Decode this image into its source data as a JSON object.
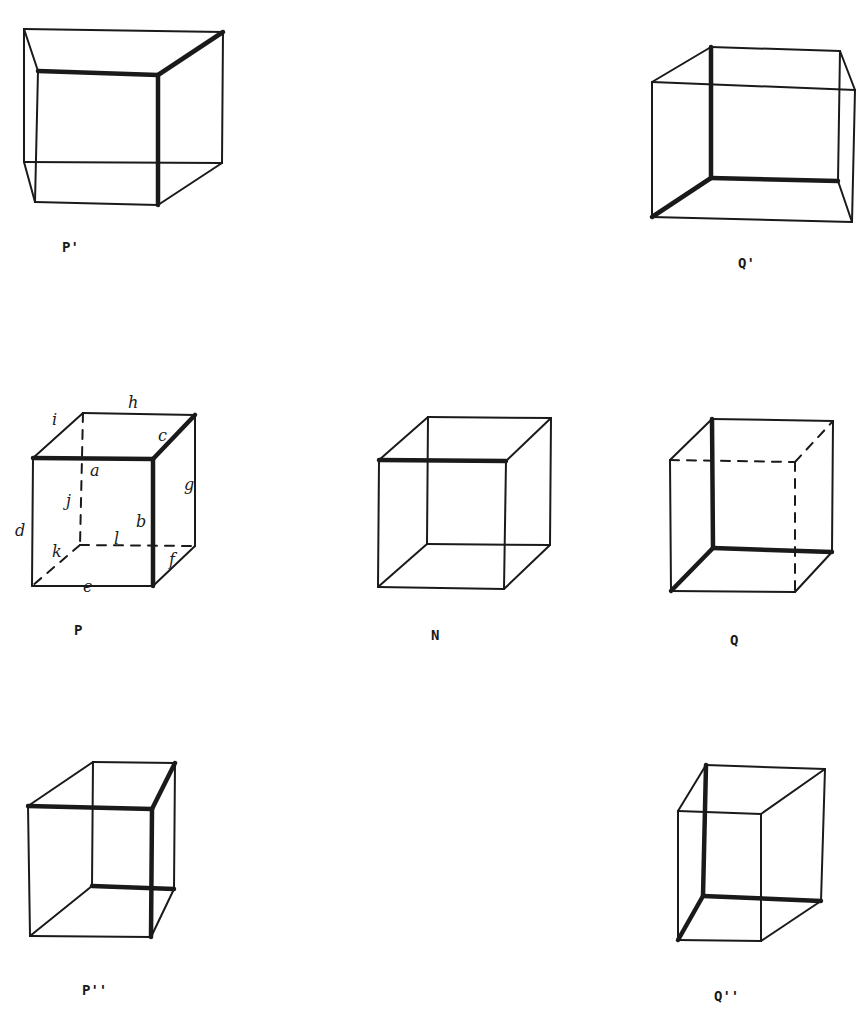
{
  "figure": {
    "background": "#ffffff",
    "ink": "#1a1a1a",
    "cubes": [
      {
        "id": "P-prime",
        "label": "P'",
        "label_pos": [
          62,
          252
        ],
        "thin": [
          [
            24,
            29,
            223,
            32
          ],
          [
            24,
            29,
            24,
            162
          ],
          [
            223,
            32,
            222,
            163
          ],
          [
            24,
            162,
            222,
            163
          ],
          [
            24,
            29,
            38,
            71
          ],
          [
            24,
            162,
            35,
            202
          ],
          [
            222,
            163,
            158,
            205
          ],
          [
            38,
            71,
            35,
            202
          ],
          [
            35,
            202,
            158,
            205
          ]
        ],
        "thick": [
          [
            38,
            71,
            158,
            75
          ],
          [
            158,
            75,
            158,
            205
          ],
          [
            158,
            75,
            223,
            32
          ]
        ],
        "dashed": []
      },
      {
        "id": "Q-prime",
        "label": "Q'",
        "label_pos": [
          738,
          268
        ],
        "thin": [
          [
            711,
            47,
            840,
            51
          ],
          [
            840,
            51,
            838,
            181
          ],
          [
            652,
            82,
            855,
            90
          ],
          [
            652,
            82,
            652,
            217
          ],
          [
            855,
            90,
            852,
            222
          ],
          [
            652,
            217,
            852,
            222
          ],
          [
            652,
            82,
            711,
            47
          ],
          [
            840,
            51,
            855,
            90
          ],
          [
            838,
            181,
            852,
            222
          ]
        ],
        "thick": [
          [
            711,
            47,
            711,
            178
          ],
          [
            711,
            178,
            838,
            181
          ],
          [
            652,
            217,
            711,
            178
          ]
        ],
        "dashed": []
      },
      {
        "id": "P",
        "label": "P",
        "label_pos": [
          74,
          635
        ],
        "thin": [
          [
            83,
            413,
            195,
            415
          ],
          [
            195,
            415,
            195,
            546
          ],
          [
            33,
            458,
            83,
            413
          ],
          [
            33,
            458,
            32,
            586
          ],
          [
            32,
            586,
            153,
            586
          ],
          [
            153,
            586,
            195,
            546
          ]
        ],
        "thick": [
          [
            33,
            458,
            153,
            459
          ],
          [
            153,
            459,
            153,
            586
          ],
          [
            153,
            459,
            195,
            415
          ]
        ],
        "dashed": [
          [
            83,
            413,
            80,
            545
          ],
          [
            80,
            545,
            195,
            546
          ],
          [
            80,
            545,
            32,
            586
          ]
        ],
        "edge_labels": [
          {
            "text": "a",
            "x": 90,
            "y": 476
          },
          {
            "text": "b",
            "x": 136,
            "y": 527
          },
          {
            "text": "c",
            "x": 158,
            "y": 441
          },
          {
            "text": "d",
            "x": 15,
            "y": 536
          },
          {
            "text": "e",
            "x": 83,
            "y": 592
          },
          {
            "text": "f",
            "x": 169,
            "y": 565
          },
          {
            "text": "g",
            "x": 184,
            "y": 490
          },
          {
            "text": "h",
            "x": 128,
            "y": 408
          },
          {
            "text": "i",
            "x": 52,
            "y": 425
          },
          {
            "text": "j",
            "x": 66,
            "y": 506
          },
          {
            "text": "k",
            "x": 52,
            "y": 557
          },
          {
            "text": "l",
            "x": 114,
            "y": 544
          }
        ]
      },
      {
        "id": "N",
        "label": "N",
        "label_pos": [
          431,
          640
        ],
        "thin": [
          [
            428,
            417,
            551,
            418
          ],
          [
            428,
            417,
            427,
            544
          ],
          [
            551,
            418,
            550,
            545
          ],
          [
            427,
            544,
            550,
            545
          ],
          [
            379,
            460,
            378,
            587
          ],
          [
            506,
            461,
            504,
            589
          ],
          [
            378,
            587,
            504,
            589
          ],
          [
            379,
            460,
            428,
            417
          ],
          [
            506,
            461,
            551,
            418
          ],
          [
            378,
            587,
            427,
            544
          ],
          [
            504,
            589,
            550,
            545
          ]
        ],
        "thick": [
          [
            379,
            460,
            506,
            461
          ]
        ],
        "dashed": []
      },
      {
        "id": "Q",
        "label": "Q",
        "label_pos": [
          730,
          645
        ],
        "thin": [
          [
            712,
            419,
            833,
            421
          ],
          [
            833,
            421,
            832,
            552
          ],
          [
            670,
            460,
            671,
            591
          ],
          [
            671,
            591,
            795,
            592
          ],
          [
            670,
            460,
            712,
            419
          ],
          [
            795,
            592,
            832,
            552
          ]
        ],
        "thick": [
          [
            712,
            419,
            713,
            548
          ],
          [
            713,
            548,
            832,
            552
          ],
          [
            671,
            591,
            713,
            548
          ]
        ],
        "dashed": [
          [
            670,
            460,
            795,
            462
          ],
          [
            795,
            462,
            795,
            592
          ],
          [
            795,
            462,
            833,
            421
          ]
        ]
      },
      {
        "id": "P-double-prime",
        "label": "P''",
        "label_pos": [
          82,
          995
        ],
        "thin": [
          [
            93,
            762,
            175,
            763
          ],
          [
            93,
            762,
            92,
            886
          ],
          [
            175,
            763,
            174,
            889
          ],
          [
            28,
            806,
            93,
            762
          ],
          [
            28,
            806,
            30,
            936
          ],
          [
            30,
            936,
            151,
            937
          ],
          [
            30,
            936,
            92,
            886
          ],
          [
            151,
            937,
            174,
            889
          ]
        ],
        "thick": [
          [
            28,
            806,
            152,
            809
          ],
          [
            152,
            809,
            151,
            937
          ],
          [
            152,
            809,
            175,
            763
          ],
          [
            92,
            886,
            174,
            889
          ]
        ],
        "dashed": []
      },
      {
        "id": "Q-double-prime",
        "label": "Q''",
        "label_pos": [
          714,
          1001
        ],
        "thin": [
          [
            706,
            765,
            825,
            769
          ],
          [
            825,
            769,
            821,
            901
          ],
          [
            678,
            811,
            761,
            814
          ],
          [
            678,
            811,
            678,
            940
          ],
          [
            761,
            814,
            761,
            941
          ],
          [
            678,
            940,
            761,
            941
          ],
          [
            678,
            811,
            706,
            765
          ],
          [
            761,
            814,
            825,
            769
          ],
          [
            761,
            941,
            821,
            901
          ]
        ],
        "thick": [
          [
            706,
            765,
            703,
            896
          ],
          [
            703,
            896,
            821,
            901
          ],
          [
            678,
            940,
            703,
            896
          ]
        ],
        "dashed": []
      }
    ]
  }
}
